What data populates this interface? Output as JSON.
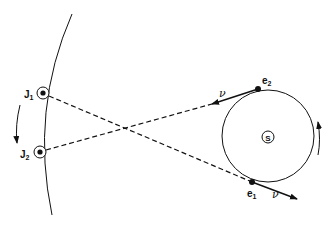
{
  "diagram": {
    "labels": {
      "j1": {
        "main": "J",
        "sub": "1"
      },
      "j2": {
        "main": "J",
        "sub": "2"
      },
      "e1": {
        "main": "e",
        "sub": "1"
      },
      "e2": {
        "main": "e",
        "sub": "2"
      },
      "sun": "S",
      "velocity_e1": "ν",
      "velocity_e2": "ν"
    },
    "elements": {
      "jupiter_orbit": "arc",
      "earth_orbit": "circle",
      "jupiter_motion_arrow": "downward",
      "earth_motion_arrow": "counterclockwise-upward",
      "sightlines": [
        "e1-J1 dashed",
        "e2-J2 dashed"
      ]
    },
    "colors": {
      "stroke": "#111111",
      "background": "#ffffff"
    }
  }
}
